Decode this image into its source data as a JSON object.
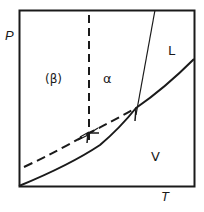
{
  "diagram": {
    "type": "phase-diagram",
    "axes": {
      "x_label": "T",
      "y_label": "P"
    },
    "regions": [
      {
        "id": "beta",
        "label": "(β)"
      },
      {
        "id": "alpha",
        "label": "α"
      },
      {
        "id": "liquid",
        "label": "L"
      },
      {
        "id": "vapor",
        "label": "V"
      }
    ],
    "lines": [
      {
        "id": "sublimation-alpha-vapor",
        "style": "solid"
      },
      {
        "id": "melting-alpha-liquid",
        "style": "thin-solid"
      },
      {
        "id": "metastable-beta-alpha",
        "style": "dashed"
      },
      {
        "id": "metastable-beta-vapor",
        "style": "dashed"
      }
    ],
    "colors": {
      "ink": "#1a1a1a",
      "background": "#ffffff"
    }
  }
}
